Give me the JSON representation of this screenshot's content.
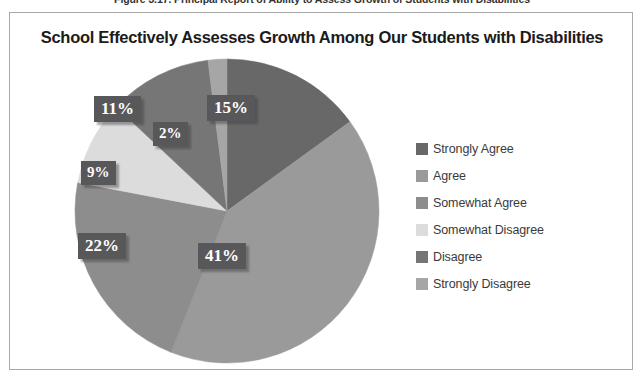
{
  "figure": {
    "caption": "Figure 3.17. Principal Report of Ability to Assess Growth of Students with Disabilities"
  },
  "chart_title": "School Effectively Assesses Growth Among Our Students with Disabilities",
  "legend": {
    "position": "right",
    "items": [
      {
        "label": "Strongly Agree",
        "color": "#686868"
      },
      {
        "label": "Agree",
        "color": "#9a9a9a"
      },
      {
        "label": "Somewhat Agree",
        "color": "#8d8d8d"
      },
      {
        "label": "Somewhat Disagree",
        "color": "#dcdcdc"
      },
      {
        "label": "Disagree",
        "color": "#767676"
      },
      {
        "label": "Strongly Disagree",
        "color": "#a6a6a6"
      }
    ]
  },
  "labels": {
    "slice_0": "15%",
    "slice_1": "41%",
    "slice_2": "22%",
    "slice_3": "9%",
    "slice_4": "11%",
    "slice_5": "2%"
  },
  "chart_data": {
    "type": "pie",
    "title": "School Effectively Assesses Growth Among Our Students with Disabilities",
    "categories": [
      "Strongly Agree",
      "Agree",
      "Somewhat Agree",
      "Somewhat Disagree",
      "Disagree",
      "Strongly Disagree"
    ],
    "values": [
      15,
      41,
      22,
      9,
      11,
      2
    ],
    "value_labels": [
      "15%",
      "41%",
      "22%",
      "9%",
      "11%",
      "2%"
    ],
    "unit": "percent",
    "colors": [
      "#686868",
      "#9a9a9a",
      "#8d8d8d",
      "#dcdcdc",
      "#767676",
      "#a6a6a6"
    ],
    "start_angle_deg": 0,
    "direction": "clockwise",
    "legend_position": "right",
    "grid": false,
    "xlabel": "",
    "ylabel": ""
  }
}
